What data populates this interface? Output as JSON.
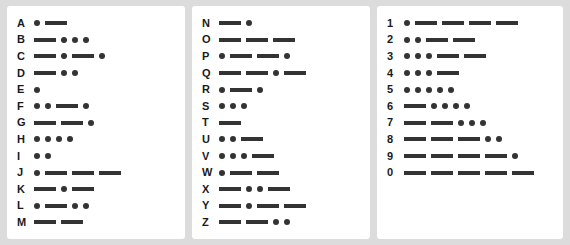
{
  "chart_data": {
    "type": "table",
    "symbol_names": {
      "dot": "dot",
      "dash": "dash"
    },
    "colors": {
      "ink": "#333333",
      "label": "#1a1a1a",
      "panel": "#ffffff",
      "background": "#dcdcdc"
    },
    "panels": [
      {
        "name": "letters-a-m",
        "rows": [
          {
            "label": "A",
            "code": [
              "dot",
              "dash"
            ]
          },
          {
            "label": "B",
            "code": [
              "dash",
              "dot",
              "dot",
              "dot"
            ]
          },
          {
            "label": "C",
            "code": [
              "dash",
              "dot",
              "dash",
              "dot"
            ]
          },
          {
            "label": "D",
            "code": [
              "dash",
              "dot",
              "dot"
            ]
          },
          {
            "label": "E",
            "code": [
              "dot"
            ]
          },
          {
            "label": "F",
            "code": [
              "dot",
              "dot",
              "dash",
              "dot"
            ]
          },
          {
            "label": "G",
            "code": [
              "dash",
              "dash",
              "dot"
            ]
          },
          {
            "label": "H",
            "code": [
              "dot",
              "dot",
              "dot",
              "dot"
            ]
          },
          {
            "label": "I",
            "code": [
              "dot",
              "dot"
            ]
          },
          {
            "label": "J",
            "code": [
              "dot",
              "dash",
              "dash",
              "dash"
            ]
          },
          {
            "label": "K",
            "code": [
              "dash",
              "dot",
              "dash"
            ]
          },
          {
            "label": "L",
            "code": [
              "dot",
              "dash",
              "dot",
              "dot"
            ]
          },
          {
            "label": "M",
            "code": [
              "dash",
              "dash"
            ]
          }
        ]
      },
      {
        "name": "letters-n-z",
        "rows": [
          {
            "label": "N",
            "code": [
              "dash",
              "dot"
            ]
          },
          {
            "label": "O",
            "code": [
              "dash",
              "dash",
              "dash"
            ]
          },
          {
            "label": "P",
            "code": [
              "dot",
              "dash",
              "dash",
              "dot"
            ]
          },
          {
            "label": "Q",
            "code": [
              "dash",
              "dash",
              "dot",
              "dash"
            ]
          },
          {
            "label": "R",
            "code": [
              "dot",
              "dash",
              "dot"
            ]
          },
          {
            "label": "S",
            "code": [
              "dot",
              "dot",
              "dot"
            ]
          },
          {
            "label": "T",
            "code": [
              "dash"
            ]
          },
          {
            "label": "U",
            "code": [
              "dot",
              "dot",
              "dash"
            ]
          },
          {
            "label": "V",
            "code": [
              "dot",
              "dot",
              "dot",
              "dash"
            ]
          },
          {
            "label": "W",
            "code": [
              "dot",
              "dash",
              "dash"
            ]
          },
          {
            "label": "X",
            "code": [
              "dash",
              "dot",
              "dot",
              "dash"
            ]
          },
          {
            "label": "Y",
            "code": [
              "dash",
              "dot",
              "dash",
              "dash"
            ]
          },
          {
            "label": "Z",
            "code": [
              "dash",
              "dash",
              "dot",
              "dot"
            ]
          }
        ]
      },
      {
        "name": "digits",
        "rows": [
          {
            "label": "1",
            "code": [
              "dot",
              "dash",
              "dash",
              "dash",
              "dash"
            ]
          },
          {
            "label": "2",
            "code": [
              "dot",
              "dot",
              "dash",
              "dash"
            ]
          },
          {
            "label": "3",
            "code": [
              "dot",
              "dot",
              "dot",
              "dash",
              "dash"
            ]
          },
          {
            "label": "4",
            "code": [
              "dot",
              "dot",
              "dot",
              "dash"
            ]
          },
          {
            "label": "5",
            "code": [
              "dot",
              "dot",
              "dot",
              "dot",
              "dot"
            ]
          },
          {
            "label": "6",
            "code": [
              "dash",
              "dot",
              "dot",
              "dot",
              "dot"
            ]
          },
          {
            "label": "7",
            "code": [
              "dash",
              "dash",
              "dot",
              "dot",
              "dot"
            ]
          },
          {
            "label": "8",
            "code": [
              "dash",
              "dash",
              "dash",
              "dot",
              "dot"
            ]
          },
          {
            "label": "9",
            "code": [
              "dash",
              "dash",
              "dash",
              "dash",
              "dot"
            ]
          },
          {
            "label": "0",
            "code": [
              "dash",
              "dash",
              "dash",
              "dash",
              "dash"
            ]
          }
        ]
      }
    ]
  }
}
